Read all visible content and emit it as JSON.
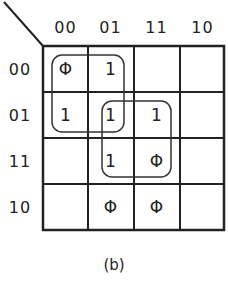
{
  "kmap": {
    "column_headers": [
      "00",
      "01",
      "11",
      "10"
    ],
    "row_headers": [
      "00",
      "01",
      "11",
      "10"
    ],
    "cells": [
      [
        "Φ",
        "1",
        "",
        ""
      ],
      [
        "1",
        "1",
        "1",
        ""
      ],
      [
        "",
        "1",
        "Φ",
        ""
      ],
      [
        "",
        "Φ",
        "Φ",
        ""
      ]
    ],
    "groups": [
      {
        "name": "group-rows00-01-cols00-01",
        "rows": [
          0,
          1
        ],
        "cols": [
          0,
          1
        ]
      },
      {
        "name": "group-rows01-11-cols01-11",
        "rows": [
          1,
          2
        ],
        "cols": [
          1,
          2
        ]
      }
    ]
  },
  "caption": "(b)"
}
